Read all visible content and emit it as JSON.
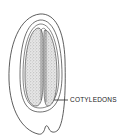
{
  "diagram": {
    "labels": [
      {
        "text": "COTYLEDONS",
        "target": "cotyledons"
      }
    ],
    "colors": {
      "line": "#333333",
      "stipple": "#9a9a9a",
      "background": "#ffffff"
    }
  }
}
